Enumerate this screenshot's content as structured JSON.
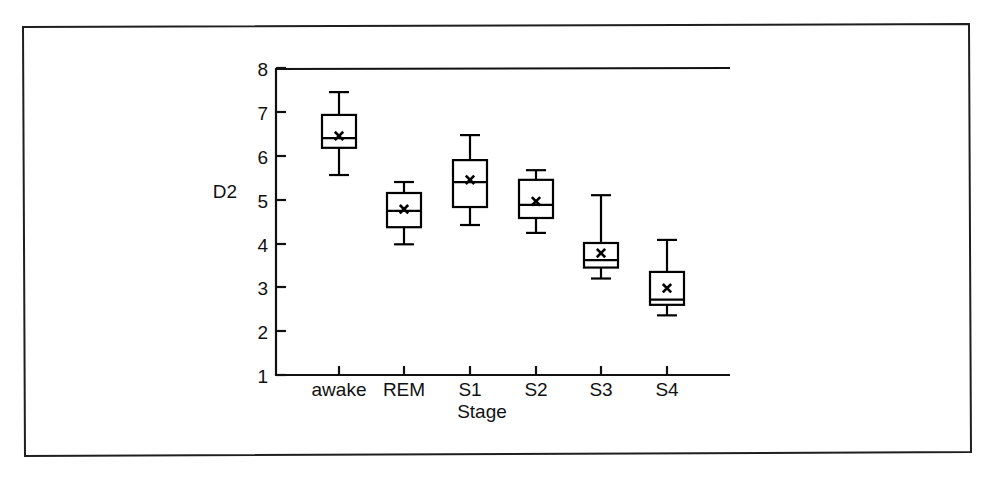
{
  "figure": {
    "border_color": "#1a1a1a",
    "line_color": "#000000",
    "background": "#ffffff"
  },
  "chart_data": {
    "type": "box",
    "title": "",
    "subtitle": "",
    "xlabel": "Stage",
    "ylabel": "D2",
    "categories": [
      "awake",
      "REM",
      "S1",
      "S2",
      "S3",
      "S4"
    ],
    "ytick_labels": [
      "1",
      "2",
      "3",
      "4",
      "5",
      "6",
      "7",
      "8"
    ],
    "yticks": [
      1,
      2,
      3,
      4,
      5,
      6,
      7,
      8
    ],
    "ylim": [
      1,
      8
    ],
    "grid": false,
    "legend": null,
    "marker_symbol": "x",
    "marker_meaning": "mean",
    "boxes": [
      {
        "category": "awake",
        "whisker_low": 5.56,
        "q1": 6.18,
        "median": 6.4,
        "q3": 6.93,
        "whisker_high": 7.45,
        "mean": 6.45
      },
      {
        "category": "REM",
        "whisker_low": 3.98,
        "q1": 4.37,
        "median": 4.74,
        "q3": 5.15,
        "whisker_high": 5.4,
        "mean": 4.78
      },
      {
        "category": "S1",
        "whisker_low": 4.42,
        "q1": 4.83,
        "median": 5.4,
        "q3": 5.9,
        "whisker_high": 6.47,
        "mean": 5.45
      },
      {
        "category": "S2",
        "whisker_low": 4.24,
        "q1": 4.58,
        "median": 4.88,
        "q3": 5.45,
        "whisker_high": 5.67,
        "mean": 4.96
      },
      {
        "category": "S3",
        "whisker_low": 3.2,
        "q1": 3.45,
        "median": 3.62,
        "q3": 4.01,
        "whisker_high": 5.1,
        "mean": 3.78
      },
      {
        "category": "S4",
        "whisker_low": 2.36,
        "q1": 2.6,
        "median": 2.72,
        "q3": 3.35,
        "whisker_high": 4.08,
        "mean": 2.98
      }
    ]
  }
}
